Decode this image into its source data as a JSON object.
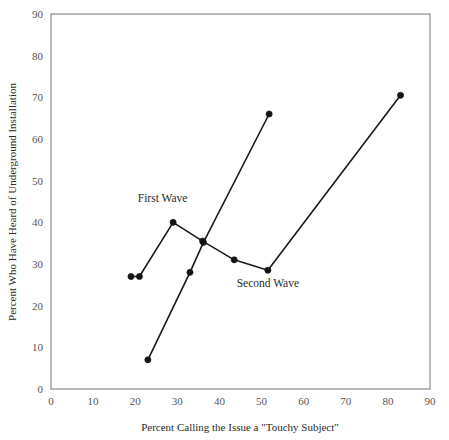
{
  "chart_data": {
    "type": "line",
    "title": "",
    "subtitle": "",
    "xlabel": "Percent Calling the Issue a \"Touchy Subject\"",
    "ylabel": "Percent Who Have Heard of Underground Installation",
    "xlim": [
      0,
      90
    ],
    "ylim": [
      0,
      90
    ],
    "xticks": [
      0,
      10,
      20,
      30,
      40,
      50,
      60,
      70,
      80,
      90
    ],
    "yticks": [
      0,
      10,
      20,
      30,
      40,
      50,
      60,
      70,
      80,
      90
    ],
    "xtick_labels": [
      "0",
      "10",
      "20",
      "30",
      "40",
      "50",
      "60",
      "70",
      "80",
      "90"
    ],
    "ytick_labels": [
      "0",
      "10",
      "20",
      "30",
      "40",
      "50",
      "60",
      "70",
      "80",
      "90"
    ],
    "grid": false,
    "legend_position": "inline-annotations",
    "marker": "filled-circle",
    "series": [
      {
        "name": "First Wave",
        "points": [
          [
            19.0,
            27.0
          ],
          [
            21.0,
            27.0
          ],
          [
            29.0,
            40.0
          ],
          [
            36.0,
            35.5
          ],
          [
            43.5,
            31.0
          ],
          [
            51.5,
            28.5
          ],
          [
            83.0,
            70.5
          ]
        ]
      },
      {
        "name": "Second Wave",
        "points": [
          [
            23.0,
            7.0
          ],
          [
            33.0,
            28.0
          ],
          [
            36.2,
            35.2
          ],
          [
            51.8,
            66.0
          ]
        ]
      }
    ],
    "annotations": [
      {
        "text": "First Wave",
        "x": 26.5,
        "y": 45.0,
        "anchor": "middle"
      },
      {
        "text": "Second Wave",
        "x": 51.5,
        "y": 24.5,
        "anchor": "middle"
      }
    ]
  },
  "axes": {
    "x_title": "Percent Calling the Issue a \"Touchy Subject\"",
    "y_title": "Percent Who Have Heard of Underground Installation"
  }
}
